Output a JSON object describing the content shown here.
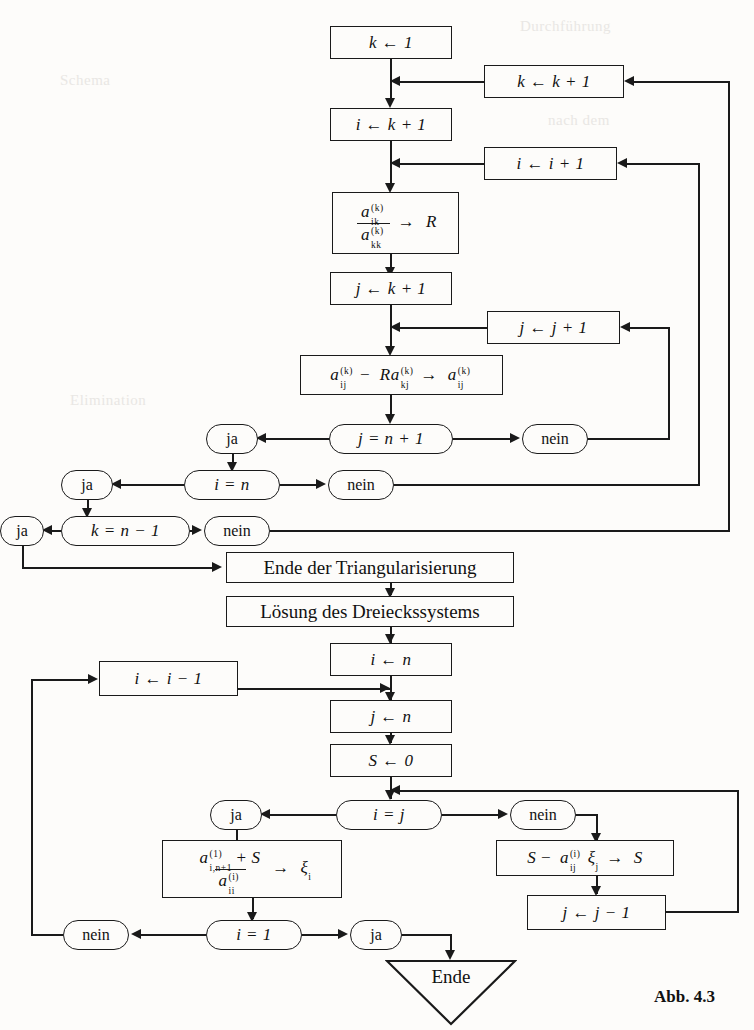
{
  "figure": {
    "caption": "Abb. 4.3",
    "language": "de"
  },
  "nodes": {
    "k_init": {
      "text": "k ← 1",
      "shape": "rect"
    },
    "k_incr": {
      "text": "k ← k + 1",
      "shape": "rect"
    },
    "i_init_k": {
      "text": "i ← k + 1",
      "shape": "rect"
    },
    "i_incr": {
      "text": "i ← i + 1",
      "shape": "rect"
    },
    "ratio": {
      "shape": "rect",
      "numerator": "a",
      "numerator_sub": "ik",
      "numerator_sup": "(k)",
      "denominator": "a",
      "denominator_sub": "kk",
      "denominator_sup": "(k)",
      "arrow": "→",
      "target": "R",
      "text": "a_ik^(k) / a_kk^(k) → R"
    },
    "j_init_k": {
      "text": "j ← k + 1",
      "shape": "rect"
    },
    "j_incr": {
      "text": "j ← j + 1",
      "shape": "rect"
    },
    "update": {
      "shape": "rect",
      "text": "a_ij^(k) − R a_kj^(k) → a_ij^(k)",
      "a1": "a",
      "a1_sub": "ij",
      "a1_sup": "(k)",
      "minus": "−",
      "r": "R",
      "a2": "a",
      "a2_sub": "kj",
      "a2_sup": "(k)",
      "arrow": "→",
      "a3": "a",
      "a3_sub": "ij",
      "a3_sup": "(k)"
    },
    "test_j": {
      "text": "j = n + 1",
      "shape": "stadium"
    },
    "test_i": {
      "text": "i = n",
      "shape": "stadium"
    },
    "test_k": {
      "text": "k = n − 1",
      "shape": "stadium"
    },
    "end_tri": {
      "text": "Ende der Triangularisierung",
      "shape": "rect"
    },
    "solve": {
      "text": "Lösung des Dreieckssystems",
      "shape": "rect"
    },
    "i_init_n": {
      "text": "i ← n",
      "shape": "rect"
    },
    "i_decr": {
      "text": "i ← i − 1",
      "shape": "rect"
    },
    "j_init_n": {
      "text": "j ← n",
      "shape": "rect"
    },
    "s_init": {
      "text": "S ← 0",
      "shape": "rect"
    },
    "test_ij": {
      "text": "i = j",
      "shape": "stadium"
    },
    "xi": {
      "shape": "rect",
      "text": "(a_{i,n+1}^{(1)} + S) / a_ii^(i) → ξ_i",
      "num_a": "a",
      "num_sub": "i,n+1",
      "num_sup": "(1)",
      "plus": "+",
      "num_s": "S",
      "den_a": "a",
      "den_sub": "ii",
      "den_sup": "(i)",
      "arrow": "→",
      "xi": "ξ",
      "xi_sub": "i"
    },
    "s_update": {
      "shape": "rect",
      "text": "S − a_ij^(i) ξ_j → S",
      "s": "S",
      "minus": "−",
      "a": "a",
      "a_sub": "ij",
      "a_sup": "(i)",
      "xi": "ξ",
      "xi_sub": "j",
      "arrow": "→",
      "target": "S"
    },
    "j_decr": {
      "text": "j ← j − 1",
      "shape": "rect"
    },
    "test_i1": {
      "text": "i = 1",
      "shape": "stadium"
    },
    "ende": {
      "text": "Ende",
      "shape": "triangle"
    }
  },
  "branch_labels": {
    "ja": "ja",
    "nein": "nein",
    "j_yes": "ja",
    "j_no": "nein",
    "i_yes": "ja",
    "i_no": "nein",
    "k_yes": "ja",
    "k_no": "nein",
    "ij_yes": "ja",
    "ij_no": "nein",
    "i1_yes": "ja",
    "i1_no": "nein"
  },
  "colors": {
    "ink": "#1a1a1a",
    "paper": "#fdfcfa",
    "ghost": "#e9e7e4"
  },
  "ghost_text": {
    "l1": "Durchführung",
    "l2": "nach dem",
    "l3": "Schema",
    "l4": "Elimination"
  }
}
